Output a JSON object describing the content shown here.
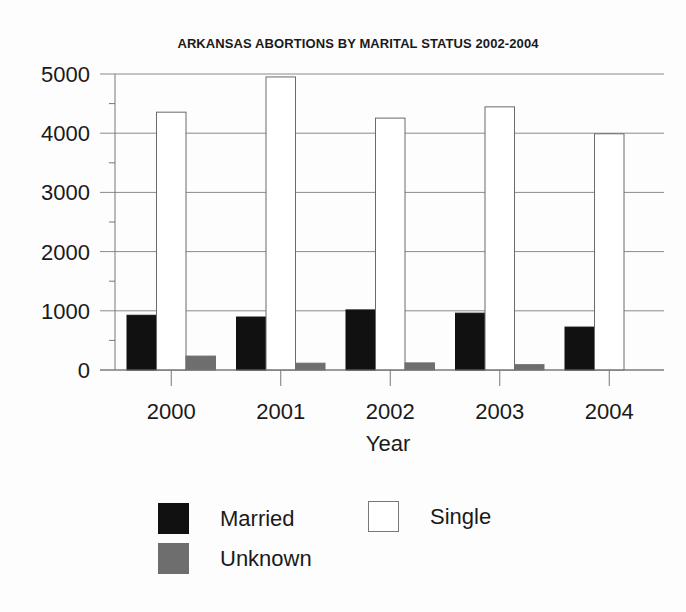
{
  "chart_data": {
    "type": "bar",
    "title": "ARKANSAS ABORTIONS BY MARITAL STATUS 2002-2004",
    "xlabel": "Year",
    "ylabel": "",
    "categories": [
      "2000",
      "2001",
      "2002",
      "2003",
      "2004"
    ],
    "series": [
      {
        "name": "Married",
        "color": "#111111",
        "values": [
          925,
          895,
          1015,
          960,
          725
        ]
      },
      {
        "name": "Single",
        "color": "#ffffff",
        "values": [
          4355,
          4950,
          4255,
          4445,
          3990
        ]
      },
      {
        "name": "Unknown",
        "color": "#6e6e6e",
        "values": [
          235,
          115,
          120,
          90,
          0
        ]
      }
    ],
    "ylim": [
      0,
      5000
    ],
    "yticks": [
      0,
      1000,
      2000,
      3000,
      4000,
      5000
    ],
    "ytick_labels": [
      "0",
      "1000",
      "2000",
      "3000",
      "4000",
      "5000"
    ],
    "grid": true,
    "legend_position": "bottom",
    "legend": [
      {
        "label": "Married",
        "color": "#111111"
      },
      {
        "label": "Single",
        "color": "#ffffff"
      },
      {
        "label": "Unknown",
        "color": "#6e6e6e"
      }
    ]
  }
}
